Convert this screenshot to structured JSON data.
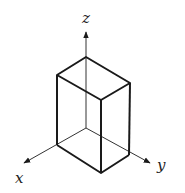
{
  "diagram": {
    "type": "3d-axes-with-box",
    "axes": {
      "x_label": "x",
      "y_label": "y",
      "z_label": "z"
    },
    "colors": {
      "line": "#1a1a1a",
      "background": "#ffffff"
    }
  }
}
